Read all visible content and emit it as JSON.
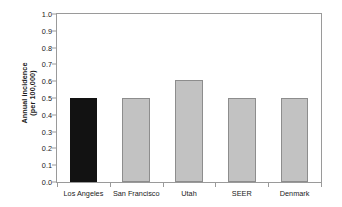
{
  "chart_data": {
    "type": "bar",
    "title": "",
    "xlabel": "",
    "ylabel": "Annual incidence (per 100,000)",
    "ylabel_line1": "Annual incidence",
    "ylabel_line2": "(per 100,000)",
    "categories": [
      "Los Angeles",
      "San Francisco",
      "Utah",
      "SEER",
      "Denmark"
    ],
    "values": [
      0.5,
      0.5,
      0.61,
      0.5,
      0.5
    ],
    "ylim": [
      0.0,
      1.0
    ],
    "ytick_labels": [
      "1.0",
      "0.9",
      "0.8",
      "0.7",
      "0.6",
      "0.5",
      "0.4",
      "0.3",
      "0.2",
      "0.1",
      "0.0"
    ],
    "ytick_values": [
      1.0,
      0.9,
      0.8,
      0.7,
      0.6,
      0.5,
      0.4,
      0.3,
      0.2,
      0.1,
      0.0
    ],
    "grid": false,
    "legend": false,
    "legend_position": "none",
    "bar_colors": [
      "#121212",
      "#c2c2c2",
      "#c2c2c2",
      "#c2c2c2",
      "#c2c2c2"
    ],
    "highlight_category": "Los Angeles",
    "colors": {
      "highlight_bar": "#121212",
      "default_bar": "#c2c2c2",
      "bar_border": "#8d8d8d",
      "axis": "#9a9a9a",
      "text": "#1a1a1a",
      "background": "#ffffff"
    }
  }
}
